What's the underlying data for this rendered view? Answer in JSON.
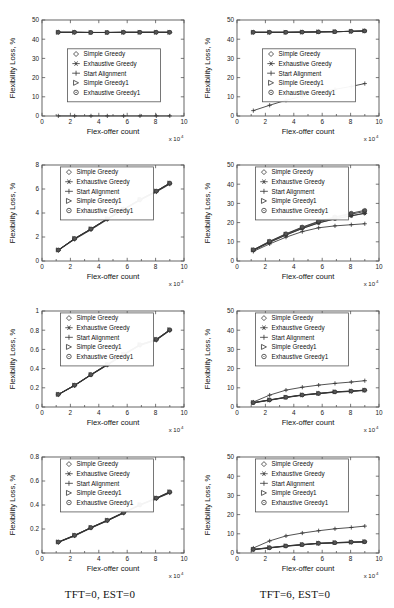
{
  "figure": {
    "columns": [
      {
        "caption": "TFT=0, EST=0"
      },
      {
        "caption": "TFT=6, EST=0"
      }
    ],
    "axis": {
      "xlabel": "Flex-offer count",
      "ylabel": "Flexibility Loss, %",
      "x_exponent_prefix": "x 10",
      "x_exponent_power": "4"
    },
    "legend": [
      {
        "label": "Simple Greedy",
        "marker": "diamond-marker"
      },
      {
        "label": "Exhaustive Greedy",
        "marker": "asterisk-marker"
      },
      {
        "label": "Start Alignment",
        "marker": "plus-marker"
      },
      {
        "label": "Simple Greedy1",
        "marker": "triangle-right-marker"
      },
      {
        "label": "Exhaustive Greedy1",
        "marker": "circle-marker"
      }
    ]
  },
  "chart_data": [
    {
      "id": "panel-r1c1",
      "type": "line",
      "title": "",
      "xlabel": "Flex-offer count",
      "ylabel": "Flexibility Loss, %",
      "xlim": [
        0,
        10
      ],
      "ylim": [
        0,
        50
      ],
      "xticks": [
        0,
        2,
        4,
        6,
        8,
        10
      ],
      "yticks": [
        0,
        10,
        20,
        30,
        40,
        50
      ],
      "grid": false,
      "legend_position": "center-left",
      "x": [
        1.15,
        2.3,
        3.45,
        4.6,
        5.75,
        6.9,
        8.05,
        9.0
      ],
      "series": [
        {
          "name": "Simple Greedy",
          "marker": "diamond",
          "values": [
            43.6,
            43.6,
            43.5,
            43.5,
            43.6,
            43.6,
            43.6,
            43.6
          ]
        },
        {
          "name": "Exhaustive Greedy",
          "marker": "asterisk",
          "values": [
            43.6,
            43.6,
            43.5,
            43.5,
            43.6,
            43.6,
            43.6,
            43.6
          ]
        },
        {
          "name": "Start Alignment",
          "marker": "plus",
          "values": [
            0.05,
            0.05,
            0.05,
            0.05,
            0.05,
            0.05,
            0.05,
            0.05
          ]
        },
        {
          "name": "Simple Greedy1",
          "marker": "triangle",
          "values": [
            43.6,
            43.6,
            43.5,
            43.5,
            43.6,
            43.6,
            43.6,
            43.6
          ]
        },
        {
          "name": "Exhaustive Greedy1",
          "marker": "circle",
          "values": [
            43.6,
            43.6,
            43.5,
            43.5,
            43.6,
            43.6,
            43.6,
            43.6
          ]
        }
      ]
    },
    {
      "id": "panel-r1c2",
      "type": "line",
      "title": "",
      "xlabel": "Flex-offer count",
      "ylabel": "Flexibility Loss, %",
      "xlim": [
        0,
        10
      ],
      "ylim": [
        0,
        50
      ],
      "xticks": [
        0,
        2,
        4,
        6,
        8,
        10
      ],
      "yticks": [
        0,
        10,
        20,
        30,
        40,
        50
      ],
      "grid": false,
      "legend_position": "center-left",
      "x": [
        1.15,
        2.3,
        3.45,
        4.6,
        5.75,
        6.9,
        8.05,
        9.0
      ],
      "series": [
        {
          "name": "Simple Greedy",
          "marker": "diamond",
          "values": [
            43.6,
            43.6,
            43.6,
            43.7,
            43.8,
            43.9,
            44.1,
            44.3
          ]
        },
        {
          "name": "Exhaustive Greedy",
          "marker": "asterisk",
          "values": [
            43.6,
            43.6,
            43.6,
            43.7,
            43.8,
            43.9,
            44.1,
            44.3
          ]
        },
        {
          "name": "Start Alignment",
          "marker": "plus",
          "values": [
            2.8,
            5.6,
            8.2,
            10.3,
            12.6,
            13.9,
            15.4,
            16.9
          ]
        },
        {
          "name": "Simple Greedy1",
          "marker": "triangle",
          "values": [
            43.6,
            43.6,
            43.6,
            43.7,
            43.8,
            43.9,
            44.1,
            44.3
          ]
        },
        {
          "name": "Exhaustive Greedy1",
          "marker": "circle",
          "values": [
            43.6,
            43.6,
            43.6,
            43.7,
            43.8,
            43.9,
            44.1,
            44.3
          ]
        }
      ]
    },
    {
      "id": "panel-r2c1",
      "type": "line",
      "title": "",
      "xlabel": "Flex-offer count",
      "ylabel": "Flexibility Loss, %",
      "xlim": [
        0,
        10
      ],
      "ylim": [
        0,
        8
      ],
      "xticks": [
        0,
        2,
        4,
        6,
        8,
        10
      ],
      "yticks": [
        0,
        2,
        4,
        6,
        8
      ],
      "grid": false,
      "legend_position": "upper-left",
      "x": [
        1.15,
        2.3,
        3.45,
        4.6,
        5.75,
        6.9,
        8.05,
        9.0
      ],
      "series": [
        {
          "name": "Simple Greedy",
          "marker": "diamond",
          "values": [
            0.9,
            1.85,
            2.65,
            3.5,
            4.3,
            5.1,
            5.8,
            6.45
          ]
        },
        {
          "name": "Exhaustive Greedy",
          "marker": "asterisk",
          "values": [
            0.9,
            1.85,
            2.65,
            3.5,
            4.3,
            5.1,
            5.8,
            6.45
          ]
        },
        {
          "name": "Start Alignment",
          "marker": "plus",
          "values": [
            0.88,
            1.8,
            2.6,
            3.45,
            4.25,
            5.05,
            5.75,
            6.4
          ]
        },
        {
          "name": "Simple Greedy1",
          "marker": "triangle",
          "values": [
            0.92,
            1.88,
            2.68,
            3.53,
            4.33,
            5.13,
            5.83,
            6.5
          ]
        },
        {
          "name": "Exhaustive Greedy1",
          "marker": "circle",
          "values": [
            0.92,
            1.88,
            2.68,
            3.53,
            4.33,
            5.13,
            5.83,
            6.5
          ]
        }
      ]
    },
    {
      "id": "panel-r2c2",
      "type": "line",
      "title": "",
      "xlabel": "Flex-offer count",
      "ylabel": "Flexibility Loss, %",
      "xlim": [
        0,
        10
      ],
      "ylim": [
        0,
        50
      ],
      "xticks": [
        0,
        2,
        4,
        6,
        8,
        10
      ],
      "yticks": [
        0,
        10,
        20,
        30,
        40,
        50
      ],
      "grid": false,
      "legend_position": "upper-left",
      "x": [
        1.15,
        2.3,
        3.45,
        4.6,
        5.75,
        6.9,
        8.05,
        9.0
      ],
      "series": [
        {
          "name": "Simple Greedy",
          "marker": "diamond",
          "values": [
            5.6,
            9.8,
            13.6,
            17.0,
            19.9,
            22.0,
            23.6,
            24.9
          ]
        },
        {
          "name": "Exhaustive Greedy",
          "marker": "asterisk",
          "values": [
            5.5,
            9.7,
            13.5,
            16.9,
            19.8,
            21.9,
            23.5,
            24.8
          ]
        },
        {
          "name": "Start Alignment",
          "marker": "plus",
          "values": [
            5.0,
            8.9,
            12.4,
            15.3,
            17.3,
            18.3,
            18.9,
            19.4
          ]
        },
        {
          "name": "Simple Greedy1",
          "marker": "triangle",
          "values": [
            5.8,
            10.1,
            14.0,
            17.4,
            20.4,
            22.6,
            24.4,
            25.8
          ]
        },
        {
          "name": "Exhaustive Greedy1",
          "marker": "circle",
          "values": [
            5.9,
            10.3,
            14.2,
            17.7,
            20.7,
            23.0,
            24.9,
            26.4
          ]
        }
      ]
    },
    {
      "id": "panel-r3c1",
      "type": "line",
      "title": "",
      "xlabel": "Flex-offer count",
      "ylabel": "Flexibility Loss, %",
      "xlim": [
        0,
        10
      ],
      "ylim": [
        0,
        1
      ],
      "xticks": [
        0,
        2,
        4,
        6,
        8,
        10
      ],
      "yticks": [
        0,
        0.2,
        0.4,
        0.6,
        0.8,
        1
      ],
      "ytick_labels": [
        "0",
        "0.2",
        "0.4",
        "0.6",
        "0.8",
        "1"
      ],
      "grid": false,
      "legend_position": "upper-left",
      "x": [
        1.15,
        2.3,
        3.45,
        4.6,
        5.75,
        6.9,
        8.05,
        9.0
      ],
      "series": [
        {
          "name": "Simple Greedy",
          "marker": "diamond",
          "values": [
            0.13,
            0.225,
            0.335,
            0.44,
            0.545,
            0.645,
            0.7,
            0.8
          ]
        },
        {
          "name": "Exhaustive Greedy",
          "marker": "asterisk",
          "values": [
            0.13,
            0.225,
            0.335,
            0.44,
            0.545,
            0.645,
            0.7,
            0.8
          ]
        },
        {
          "name": "Start Alignment",
          "marker": "plus",
          "values": [
            0.128,
            0.222,
            0.332,
            0.435,
            0.54,
            0.64,
            0.695,
            0.795
          ]
        },
        {
          "name": "Simple Greedy1",
          "marker": "triangle",
          "values": [
            0.132,
            0.228,
            0.338,
            0.445,
            0.55,
            0.65,
            0.705,
            0.805
          ]
        },
        {
          "name": "Exhaustive Greedy1",
          "marker": "circle",
          "values": [
            0.132,
            0.228,
            0.338,
            0.445,
            0.55,
            0.65,
            0.705,
            0.805
          ]
        }
      ]
    },
    {
      "id": "panel-r3c2",
      "type": "line",
      "title": "",
      "xlabel": "Flex-offer count",
      "ylabel": "Flexibility Loss, %",
      "xlim": [
        0,
        10
      ],
      "ylim": [
        0,
        50
      ],
      "xticks": [
        0,
        2,
        4,
        6,
        8,
        10
      ],
      "yticks": [
        0,
        10,
        20,
        30,
        40,
        50
      ],
      "grid": false,
      "legend_position": "upper-left",
      "x": [
        1.15,
        2.3,
        3.45,
        4.6,
        5.75,
        6.9,
        8.05,
        9.0
      ],
      "series": [
        {
          "name": "Simple Greedy",
          "marker": "diamond",
          "values": [
            2.2,
            3.6,
            5.0,
            6.2,
            7.0,
            7.8,
            8.2,
            8.7
          ]
        },
        {
          "name": "Exhaustive Greedy",
          "marker": "asterisk",
          "values": [
            2.1,
            3.5,
            4.9,
            6.1,
            6.9,
            7.7,
            8.1,
            8.6
          ]
        },
        {
          "name": "Start Alignment",
          "marker": "plus",
          "values": [
            2.6,
            6.2,
            8.8,
            10.3,
            11.4,
            12.3,
            13.0,
            13.7
          ]
        },
        {
          "name": "Simple Greedy1",
          "marker": "triangle",
          "values": [
            2.3,
            3.7,
            5.1,
            6.3,
            7.1,
            7.9,
            8.3,
            8.8
          ]
        },
        {
          "name": "Exhaustive Greedy1",
          "marker": "circle",
          "values": [
            2.3,
            3.7,
            5.1,
            6.3,
            7.1,
            7.9,
            8.3,
            8.8
          ]
        }
      ]
    },
    {
      "id": "panel-r4c1",
      "type": "line",
      "title": "",
      "xlabel": "Flex-offer count",
      "ylabel": "Flexibility Loss, %",
      "xlim": [
        0,
        10
      ],
      "ylim": [
        0,
        0.8
      ],
      "xticks": [
        0,
        2,
        4,
        6,
        8,
        10
      ],
      "yticks": [
        0,
        0.2,
        0.4,
        0.6,
        0.8
      ],
      "ytick_labels": [
        "0",
        "0.2",
        "0.4",
        "0.6",
        "0.8"
      ],
      "grid": false,
      "legend_position": "upper-left",
      "x": [
        1.15,
        2.3,
        3.45,
        4.6,
        5.75,
        6.9,
        8.05,
        9.0
      ],
      "series": [
        {
          "name": "Simple Greedy",
          "marker": "diamond",
          "values": [
            0.09,
            0.145,
            0.21,
            0.27,
            0.335,
            0.4,
            0.455,
            0.505
          ]
        },
        {
          "name": "Exhaustive Greedy",
          "marker": "asterisk",
          "values": [
            0.09,
            0.145,
            0.21,
            0.27,
            0.335,
            0.4,
            0.455,
            0.505
          ]
        },
        {
          "name": "Start Alignment",
          "marker": "plus",
          "values": [
            0.088,
            0.142,
            0.207,
            0.267,
            0.332,
            0.397,
            0.452,
            0.5
          ]
        },
        {
          "name": "Simple Greedy1",
          "marker": "triangle",
          "values": [
            0.092,
            0.148,
            0.213,
            0.273,
            0.338,
            0.403,
            0.458,
            0.51
          ]
        },
        {
          "name": "Exhaustive Greedy1",
          "marker": "circle",
          "values": [
            0.092,
            0.148,
            0.213,
            0.273,
            0.338,
            0.403,
            0.458,
            0.51
          ]
        }
      ]
    },
    {
      "id": "panel-r4c2",
      "type": "line",
      "title": "",
      "xlabel": "Flex-offer count",
      "ylabel": "Flexibility Loss, %",
      "xlim": [
        0,
        10
      ],
      "ylim": [
        0,
        50
      ],
      "xticks": [
        0,
        2,
        4,
        6,
        8,
        10
      ],
      "yticks": [
        0,
        10,
        20,
        30,
        40,
        50
      ],
      "grid": false,
      "legend_position": "upper-left",
      "x": [
        1.15,
        2.3,
        3.45,
        4.6,
        5.75,
        6.9,
        8.05,
        9.0
      ],
      "series": [
        {
          "name": "Simple Greedy",
          "marker": "diamond",
          "values": [
            1.8,
            2.7,
            3.6,
            4.3,
            5.0,
            5.3,
            5.6,
            5.8
          ]
        },
        {
          "name": "Exhaustive Greedy",
          "marker": "asterisk",
          "values": [
            1.7,
            2.6,
            3.5,
            4.2,
            4.9,
            5.2,
            5.5,
            5.7
          ]
        },
        {
          "name": "Start Alignment",
          "marker": "plus",
          "values": [
            2.6,
            6.3,
            8.9,
            10.4,
            11.6,
            12.6,
            13.3,
            14.0
          ]
        },
        {
          "name": "Simple Greedy1",
          "marker": "triangle",
          "values": [
            1.9,
            2.8,
            3.7,
            4.4,
            5.1,
            5.4,
            5.7,
            5.9
          ]
        },
        {
          "name": "Exhaustive Greedy1",
          "marker": "circle",
          "values": [
            1.9,
            2.8,
            3.7,
            4.4,
            5.1,
            5.4,
            5.7,
            5.9
          ]
        }
      ]
    }
  ]
}
